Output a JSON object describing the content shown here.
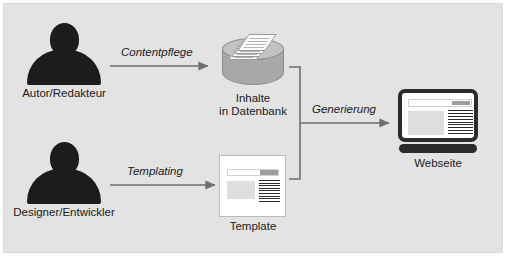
{
  "diagram": {
    "background_color": "#e3e3e3",
    "line_color": "#6e6e6e",
    "silhouette_color": "#1c1c1c",
    "nodes": [
      {
        "id": "autor",
        "type": "person",
        "label": "Autor/Redakteur"
      },
      {
        "id": "designer",
        "type": "person",
        "label": "Designer/Entwickler"
      },
      {
        "id": "datenbank",
        "type": "database-cylinder",
        "label_line1": "Inhalte",
        "label_line2": "in Datenbank"
      },
      {
        "id": "template",
        "type": "document-page",
        "label": "Template"
      },
      {
        "id": "webseite",
        "type": "monitor",
        "label": "Webseite"
      }
    ],
    "edges": [
      {
        "id": "contentpflege",
        "from": "autor",
        "to": "datenbank",
        "label": "Contentpflege"
      },
      {
        "id": "templating",
        "from": "designer",
        "to": "template",
        "label": "Templating"
      },
      {
        "id": "generierung",
        "from": "datenbank+template",
        "to": "webseite",
        "label": "Generierung"
      }
    ]
  }
}
